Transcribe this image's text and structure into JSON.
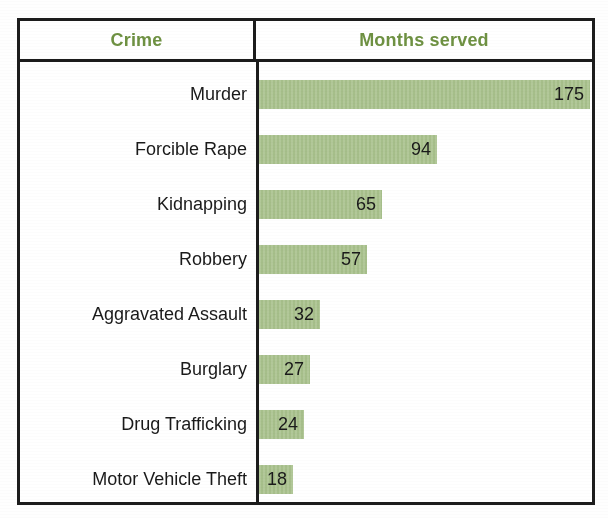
{
  "table": {
    "headers": {
      "crime": "Crime",
      "months": "Months served"
    },
    "header_color": "#6e9142",
    "bar_color": "#a9c28d",
    "border_color": "#1c1c1c",
    "text_color": "#1a1a1a",
    "rows": [
      {
        "crime": "Murder",
        "months": 175,
        "months_label": "175"
      },
      {
        "crime": "Forcible Rape",
        "months": 94,
        "months_label": "94"
      },
      {
        "crime": "Kidnapping",
        "months": 65,
        "months_label": "65"
      },
      {
        "crime": "Robbery",
        "months": 57,
        "months_label": "57"
      },
      {
        "crime": "Aggravated Assault",
        "months": 32,
        "months_label": "32"
      },
      {
        "crime": "Burglary",
        "months": 27,
        "months_label": "27"
      },
      {
        "crime": "Drug Trafficking",
        "months": 24,
        "months_label": "24"
      },
      {
        "crime": "Motor Vehicle Theft",
        "months": 18,
        "months_label": "18"
      }
    ]
  },
  "chart_data": {
    "type": "bar",
    "orientation": "horizontal",
    "title": "",
    "xlabel": "Months served",
    "ylabel": "Crime",
    "categories": [
      "Murder",
      "Forcible Rape",
      "Kidnapping",
      "Robbery",
      "Aggravated Assault",
      "Burglary",
      "Drug Trafficking",
      "Motor Vehicle Theft"
    ],
    "values": [
      175,
      94,
      65,
      57,
      32,
      27,
      24,
      18
    ],
    "data_labels": [
      "175",
      "94",
      "65",
      "57",
      "32",
      "27",
      "24",
      "18"
    ],
    "xlim": [
      0,
      175
    ],
    "grid": false,
    "legend": null,
    "column_headers": [
      "Crime",
      "Months served"
    ],
    "bar_color": "#a9c28d",
    "header_text_color": "#6e9142"
  }
}
